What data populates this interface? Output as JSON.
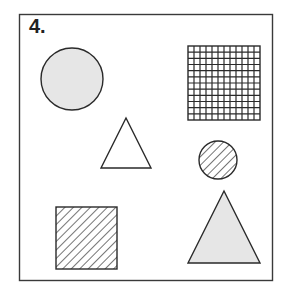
{
  "figure": {
    "label": "4.",
    "colors": {
      "stroke": "#2a2a2a",
      "frame": "#3a3a3a",
      "gray_fill": "#e6e6e6",
      "white_fill": "#ffffff"
    },
    "shapes": [
      {
        "id": "gray-circle",
        "kind": "circle",
        "fill": "gray"
      },
      {
        "id": "grid-square",
        "kind": "square",
        "fill": "grid",
        "grid_cells": 12
      },
      {
        "id": "white-triangle",
        "kind": "triangle",
        "fill": "white"
      },
      {
        "id": "hatched-circle",
        "kind": "circle",
        "fill": "hatched"
      },
      {
        "id": "hatched-square",
        "kind": "square",
        "fill": "hatched"
      },
      {
        "id": "gray-triangle",
        "kind": "triangle",
        "fill": "gray"
      }
    ]
  }
}
